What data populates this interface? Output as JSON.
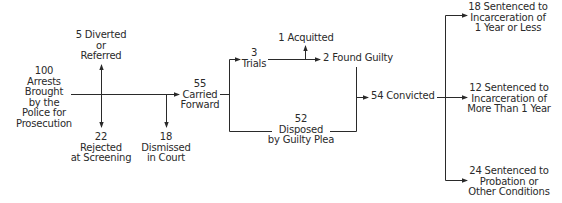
{
  "diagram": {
    "type": "flowchart",
    "nodes": {
      "arrests": {
        "count": "100",
        "lines": [
          "100",
          "Arrests",
          "Brought",
          "by the",
          "Police for",
          "Prosecution"
        ]
      },
      "diverted": {
        "lines": [
          "5 Diverted",
          "or",
          "Referred"
        ]
      },
      "rejected": {
        "lines": [
          "22",
          "Rejected",
          "at Screening"
        ]
      },
      "dismissed": {
        "lines": [
          "18",
          "Dismissed",
          "in Court"
        ]
      },
      "carried": {
        "lines": [
          "55",
          "Carried",
          "Forward"
        ]
      },
      "trials": {
        "lines": [
          "3",
          "Trials"
        ]
      },
      "acquitted": {
        "lines": [
          "1 Acquitted"
        ]
      },
      "guilty": {
        "lines": [
          "2 Found Guilty"
        ]
      },
      "plea": {
        "lines": [
          "52",
          "Disposed",
          "by Guilty Plea"
        ]
      },
      "convicted": {
        "lines": [
          "54 Convicted"
        ]
      },
      "sentence_short": {
        "lines": [
          "18 Sentenced to",
          "Incarceration of",
          "1 Year or Less"
        ]
      },
      "sentence_long": {
        "lines": [
          "12 Sentenced to",
          "Incarceration of",
          "More Than 1 Year"
        ]
      },
      "probation": {
        "lines": [
          "24 Sentenced to",
          "Probation or",
          "Other Conditions"
        ]
      }
    },
    "edges": [
      {
        "from": "arrests",
        "to": "diverted"
      },
      {
        "from": "arrests",
        "to": "rejected"
      },
      {
        "from": "arrests",
        "to": "dismissed"
      },
      {
        "from": "arrests",
        "to": "carried"
      },
      {
        "from": "carried",
        "to": "trials"
      },
      {
        "from": "carried",
        "to": "plea"
      },
      {
        "from": "trials",
        "to": "acquitted"
      },
      {
        "from": "trials",
        "to": "guilty"
      },
      {
        "from": "guilty",
        "to": "convicted"
      },
      {
        "from": "plea",
        "to": "convicted"
      },
      {
        "from": "convicted",
        "to": "sentence_short"
      },
      {
        "from": "convicted",
        "to": "sentence_long"
      },
      {
        "from": "convicted",
        "to": "probation"
      }
    ],
    "line_color": "#2a2a2a"
  }
}
